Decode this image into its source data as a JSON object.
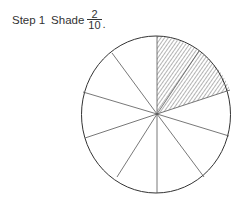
{
  "instruction": {
    "step_label": "Step",
    "step_number": "1",
    "action": "Shade",
    "fraction": {
      "numerator": "2",
      "denominator": "10"
    },
    "punctuation": "."
  },
  "circle": {
    "total_sections": 10,
    "shaded_sections": 2,
    "shaded_positions": [
      "top-right-1",
      "top-right-2"
    ],
    "fill_pattern": "diagonal-hatch",
    "stroke_color": "#333333",
    "hatch_color": "#444444"
  }
}
